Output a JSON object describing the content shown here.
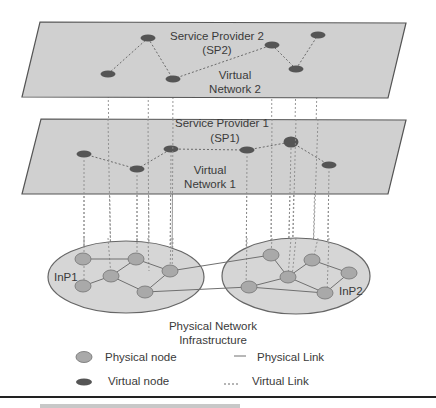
{
  "diagram": {
    "layers": [
      {
        "id": "sp2",
        "title_line1": "Service Provider 2",
        "title_line2": "(SP2)",
        "network_line1": "Virtual",
        "network_line2": "Network 2",
        "plane": [
          [
            40,
            22
          ],
          [
            406,
            23
          ],
          [
            388,
            98
          ],
          [
            22,
            97
          ]
        ],
        "nodes": [
          [
            108,
            74
          ],
          [
            148,
            38
          ],
          [
            173,
            79
          ],
          [
            272,
            45
          ],
          [
            296,
            69
          ],
          [
            318,
            35
          ]
        ],
        "links": [
          [
            0,
            1
          ],
          [
            1,
            2
          ],
          [
            2,
            3
          ],
          [
            3,
            4
          ],
          [
            4,
            5
          ]
        ]
      },
      {
        "id": "sp1",
        "title_line1": "Service Provider 1",
        "title_line2": "(SP1)",
        "network_line1": "Virtual",
        "network_line2": "Network 1",
        "plane": [
          [
            41,
            119
          ],
          [
            406,
            120
          ],
          [
            388,
            194
          ],
          [
            22,
            194
          ]
        ],
        "nodes": [
          [
            84,
            154
          ],
          [
            137,
            169
          ],
          [
            171,
            149
          ],
          [
            247,
            150
          ],
          [
            291,
            142
          ],
          [
            329,
            165
          ]
        ],
        "links": [
          [
            0,
            1
          ],
          [
            1,
            2
          ],
          [
            2,
            3
          ],
          [
            3,
            4
          ],
          [
            4,
            5
          ]
        ]
      }
    ],
    "physical": {
      "title_line1": "Physical Network",
      "title_line2": "Infrastructure",
      "domains": [
        {
          "id": "inp1",
          "label": "InP1",
          "cx": 126,
          "cy": 277,
          "rx": 78,
          "ry": 36
        },
        {
          "id": "inp2",
          "label": "InP2",
          "cx": 296,
          "cy": 276,
          "rx": 74,
          "ry": 38
        }
      ],
      "nodes": [
        [
          83,
          259
        ],
        [
          136,
          259
        ],
        [
          111,
          276
        ],
        [
          83,
          286
        ],
        [
          170,
          271
        ],
        [
          145,
          292
        ],
        [
          271,
          255
        ],
        [
          312,
          260
        ],
        [
          288,
          277
        ],
        [
          349,
          273
        ],
        [
          249,
          287
        ],
        [
          325,
          293
        ]
      ],
      "links": [
        [
          0,
          1
        ],
        [
          1,
          2
        ],
        [
          2,
          3
        ],
        [
          1,
          4
        ],
        [
          2,
          5
        ],
        [
          4,
          5
        ],
        [
          6,
          8
        ],
        [
          7,
          8
        ],
        [
          7,
          9
        ],
        [
          8,
          10
        ],
        [
          8,
          11
        ],
        [
          9,
          11
        ],
        [
          10,
          11
        ],
        [
          4,
          6
        ],
        [
          5,
          10
        ]
      ]
    },
    "mappings": [
      [
        108,
        80,
        111,
        276
      ],
      [
        148,
        44,
        149,
        271
      ],
      [
        173,
        85,
        172,
        271
      ],
      [
        272,
        51,
        271,
        255
      ],
      [
        296,
        75,
        292,
        277
      ],
      [
        318,
        41,
        313,
        260
      ],
      [
        84,
        160,
        84,
        286
      ],
      [
        137,
        175,
        137,
        259
      ],
      [
        171,
        155,
        170,
        271
      ],
      [
        247,
        156,
        246,
        287
      ],
      [
        291,
        148,
        288,
        277
      ],
      [
        329,
        171,
        327,
        293
      ]
    ],
    "legend": {
      "physical_node": "Physical node",
      "virtual_node": "Virtual node",
      "physical_link": "Physical Link",
      "virtual_link": "Virtual Link"
    },
    "colors": {
      "plane_fill": "#d0d0d0",
      "domain_fill": "#d6d6d6",
      "physical_node": "#a9a9a9",
      "virtual_node": "#555555"
    }
  }
}
